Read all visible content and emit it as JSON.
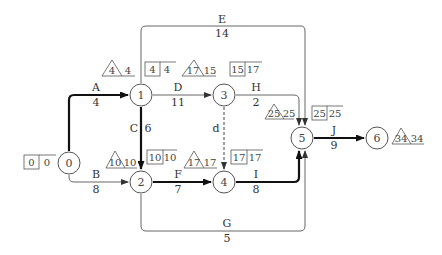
{
  "diagram": {
    "type": "activity-on-arrow network (critical path)",
    "nodes": [
      {
        "id": "0",
        "label": "0",
        "x": 69,
        "y": 163,
        "box": [
          "0",
          "0"
        ]
      },
      {
        "id": "1",
        "label": "1",
        "x": 141,
        "y": 95,
        "tri": [
          "4",
          "4"
        ],
        "box": [
          "4",
          "4"
        ]
      },
      {
        "id": "2",
        "label": "2",
        "x": 141,
        "y": 182,
        "tri": [
          "10",
          "10"
        ],
        "box": [
          "10",
          "10"
        ]
      },
      {
        "id": "3",
        "label": "3",
        "x": 224,
        "y": 95,
        "tri": [
          "17",
          "15"
        ],
        "box": [
          "15",
          "17"
        ]
      },
      {
        "id": "4",
        "label": "4",
        "x": 224,
        "y": 182,
        "tri": [
          "17",
          "17"
        ],
        "box": [
          "17",
          "17"
        ]
      },
      {
        "id": "5",
        "label": "5",
        "x": 302,
        "y": 138,
        "tri": [
          "25",
          "25"
        ],
        "box": [
          "25",
          "25"
        ]
      },
      {
        "id": "6",
        "label": "6",
        "x": 377,
        "y": 138,
        "tri": [
          "34",
          "34"
        ]
      }
    ],
    "activities": [
      {
        "name": "A",
        "duration": "4",
        "from": "0",
        "to": "1",
        "critical": true
      },
      {
        "name": "B",
        "duration": "8",
        "from": "0",
        "to": "2",
        "critical": false
      },
      {
        "name": "C",
        "duration": "6",
        "from": "1",
        "to": "2",
        "critical": true
      },
      {
        "name": "D",
        "duration": "11",
        "from": "1",
        "to": "3",
        "critical": false
      },
      {
        "name": "E",
        "duration": "14",
        "from": "1",
        "to": "5",
        "critical": false
      },
      {
        "name": "F",
        "duration": "7",
        "from": "2",
        "to": "4",
        "critical": true
      },
      {
        "name": "G",
        "duration": "5",
        "from": "2",
        "to": "5",
        "critical": false
      },
      {
        "name": "H",
        "duration": "2",
        "from": "3",
        "to": "5",
        "critical": false
      },
      {
        "name": "d",
        "duration": "",
        "from": "3",
        "to": "4",
        "critical": false,
        "dummy": true
      },
      {
        "name": "I",
        "duration": "8",
        "from": "4",
        "to": "5",
        "critical": true
      },
      {
        "name": "J",
        "duration": "9",
        "from": "5",
        "to": "6",
        "critical": true
      }
    ]
  },
  "labels": {
    "n0": "0",
    "n1": "1",
    "n2": "2",
    "n3": "3",
    "n4": "4",
    "n5": "5",
    "n6": "6",
    "A": "A",
    "A_d": "4",
    "B": "B",
    "B_d": "8",
    "C": "C",
    "C_d": "6",
    "D": "D",
    "D_d": "11",
    "E": "E",
    "E_d": "14",
    "F": "F",
    "F_d": "7",
    "G": "G",
    "G_d": "5",
    "H": "H",
    "H_d": "2",
    "dummy": "d",
    "I": "I",
    "I_d": "8",
    "J": "J",
    "J_d": "9",
    "box0_a": "0",
    "box0_b": "0",
    "tri1": "4",
    "tri1_b": "4",
    "box1_a": "4",
    "box1_b": "4",
    "tri2": "10",
    "tri2_b": "10",
    "box2_a": "10",
    "box2_b": "10",
    "tri3": "17",
    "tri3_b": "15",
    "box3_a": "15",
    "box3_b": "17",
    "tri4": "17",
    "tri4_b": "17",
    "box4_a": "17",
    "box4_b": "17",
    "tri5": "25",
    "tri5_b": "25",
    "box5_a": "25",
    "box5_b": "25",
    "tri6": "34",
    "tri6_b": "34"
  },
  "colors": {
    "critical": "#111111",
    "normal": "#666666",
    "text": "#333333"
  }
}
